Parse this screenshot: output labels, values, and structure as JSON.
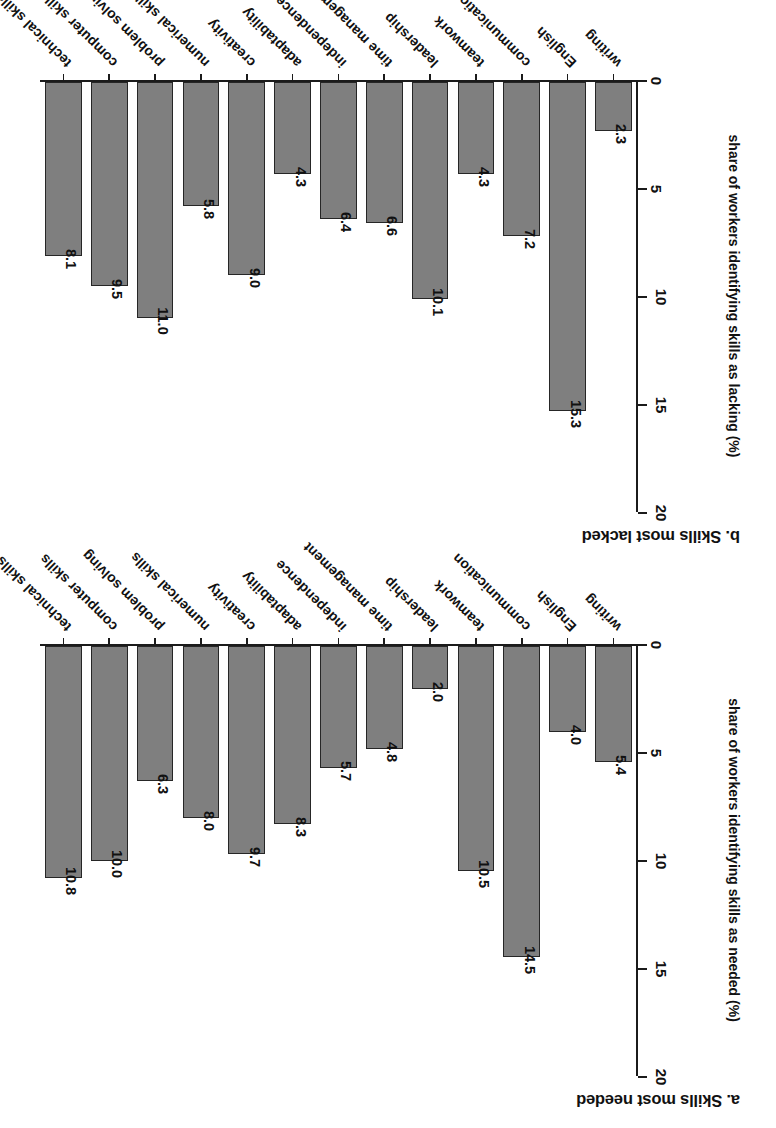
{
  "figure": {
    "orientation_note": "rotated-180",
    "bar_fill_color": "#7f7f7f",
    "bar_edge_color": "#262626",
    "axis_color": "#1b1b1b"
  },
  "chart_data": [
    {
      "type": "bar",
      "panel": "a",
      "title": "a. Skills most needed",
      "xlabel": "",
      "ylabel": "share of workers identifying skills as needed (%)",
      "ylim": [
        0,
        20
      ],
      "yticks": [
        "0",
        "5",
        "10",
        "15",
        "20"
      ],
      "ytick_values": [
        0,
        5,
        10,
        15,
        20
      ],
      "grid": false,
      "legend": "none",
      "categories": [
        "writing",
        "English",
        "communication",
        "teamwork",
        "leadership",
        "time management",
        "independence",
        "adaptability",
        "creativity",
        "numerical skills",
        "problem solving",
        "computer skills",
        "technical skills"
      ],
      "values": [
        5.4,
        4.0,
        14.5,
        10.5,
        2.0,
        4.8,
        5.7,
        8.3,
        9.7,
        8.0,
        6.3,
        10.0,
        10.8
      ],
      "labels": [
        "5.4",
        "4.0",
        "14.5",
        "10.5",
        "2.0",
        "4.8",
        "5.7",
        "8.3",
        "9.7",
        "8.0",
        "6.3",
        "10.0",
        "10.8"
      ],
      "labels_shown": [
        true,
        true,
        true,
        true,
        true,
        true,
        true,
        true,
        true,
        true,
        true,
        true,
        true
      ]
    },
    {
      "type": "bar",
      "panel": "b",
      "title": "b. Skills most lacked",
      "xlabel": "",
      "ylabel": "share of workers identifying skills as lacking (%)",
      "ylim": [
        0,
        20
      ],
      "yticks": [
        "0",
        "5",
        "10",
        "15",
        "20"
      ],
      "ytick_values": [
        0,
        5,
        10,
        15,
        20
      ],
      "grid": false,
      "legend": "none",
      "categories": [
        "writing",
        "English",
        "communication",
        "teamwork",
        "leadership",
        "time management",
        "independence",
        "adaptability",
        "creativity",
        "numerical skills",
        "problem solving",
        "computer skills",
        "technical skills"
      ],
      "values": [
        2.3,
        15.3,
        7.2,
        4.3,
        10.1,
        6.6,
        6.4,
        4.3,
        9.0,
        5.8,
        11.0,
        9.5,
        8.1
      ],
      "labels": [
        "2.3",
        "15.3",
        "7.2",
        "4.3",
        "10.1",
        "6.6",
        "6.4",
        "4.3",
        "9.0",
        "5.8",
        "11.0",
        "9.5",
        "8.1"
      ],
      "labels_shown": [
        true,
        true,
        true,
        true,
        true,
        true,
        true,
        true,
        true,
        true,
        true,
        true,
        true
      ]
    }
  ]
}
